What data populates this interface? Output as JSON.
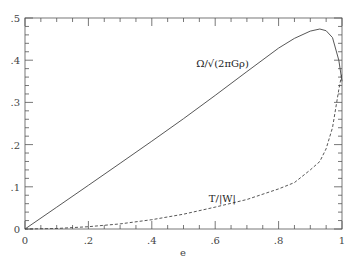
{
  "chart_data": {
    "type": "line",
    "title": "",
    "xlabel": "e",
    "ylabel": "",
    "xlim": [
      0,
      1
    ],
    "ylim": [
      0,
      0.5
    ],
    "grid": false,
    "x_ticks": [
      "0",
      ".2",
      ".4",
      ".6",
      ".8",
      "1"
    ],
    "y_ticks": [
      "0",
      ".1",
      ".2",
      ".3",
      ".4",
      ".5"
    ],
    "x": [
      0,
      0.1,
      0.2,
      0.3,
      0.4,
      0.5,
      0.6,
      0.7,
      0.8,
      0.85,
      0.9,
      0.93,
      0.95,
      0.97,
      0.99,
      1.0
    ],
    "series": [
      {
        "name": "Ω/√(2πGρ)",
        "style": "solid",
        "values": [
          0,
          0.0517,
          0.1035,
          0.1557,
          0.2081,
          0.2614,
          0.3165,
          0.373,
          0.4286,
          0.4516,
          0.469,
          0.474,
          0.47,
          0.4535,
          0.4,
          0.35
        ]
      },
      {
        "name": "T/|W|",
        "style": "dashed",
        "values": [
          0,
          0.0013,
          0.0054,
          0.0122,
          0.022,
          0.035,
          0.052,
          0.07,
          0.095,
          0.11,
          0.14,
          0.16,
          0.19,
          0.24,
          0.33,
          0.37
        ]
      }
    ],
    "annotations": [
      {
        "text": "Ω/√(2πGρ)",
        "x": 0.54,
        "y": 0.385
      },
      {
        "text": "T/|W|",
        "x": 0.58,
        "y": 0.065
      }
    ]
  }
}
